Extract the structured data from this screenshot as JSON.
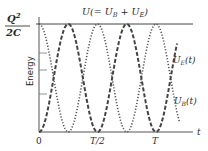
{
  "chart_data": {
    "type": "line",
    "title": "",
    "xlabel": "t",
    "ylabel": "Energy",
    "x_ticks": [
      {
        "label": "0",
        "value": 0
      },
      {
        "label": "T/2",
        "value": 0.5
      },
      {
        "label": "T",
        "value": 1.0
      }
    ],
    "y_max_label": {
      "numerator": "Q²",
      "denominator": "2C"
    },
    "xlim": [
      0,
      1.3
    ],
    "ylim": [
      0,
      1
    ],
    "grid": false,
    "legend": "inline",
    "series": [
      {
        "name": "U(= U_B + U_E)",
        "label": "U(= U_B + U_E)",
        "style": "solid",
        "formula": "U = Q²/2C (constant)",
        "x": [
          0,
          0.25,
          0.5,
          0.75,
          1.0,
          1.25
        ],
        "values": [
          1,
          1,
          1,
          1,
          1,
          1
        ]
      },
      {
        "name": "U_E(t)",
        "label": "U_E(t)",
        "style": "dotted",
        "formula": "U cos²(2πt/T)",
        "x": [
          0,
          0.125,
          0.25,
          0.375,
          0.5,
          0.625,
          0.75,
          0.875,
          1.0,
          1.125,
          1.25
        ],
        "values": [
          1,
          0.5,
          0,
          0.5,
          1,
          0.5,
          0,
          0.5,
          1,
          0.5,
          0
        ]
      },
      {
        "name": "U_B(t)",
        "label": "U_B(t)",
        "style": "dashed",
        "formula": "U sin²(2πt/T)",
        "x": [
          0,
          0.125,
          0.25,
          0.375,
          0.5,
          0.625,
          0.75,
          0.875,
          1.0,
          1.125,
          1.25
        ],
        "values": [
          0,
          0.5,
          1,
          0.5,
          0,
          0.5,
          1,
          0.5,
          0,
          0.5,
          1
        ]
      }
    ]
  },
  "labels": {
    "ymax_num": "Q",
    "ymax_sup": "2",
    "ymax_den": "2C",
    "total": "U(= U",
    "total_sub1": "B",
    "total_mid": " + U",
    "total_sub2": "E",
    "total_end": ")",
    "ue": "U",
    "ue_sub": "E",
    "ue_end": "(t)",
    "ub": "U",
    "ub_sub": "B",
    "ub_end": "(t)",
    "energy": "Energy",
    "x0": "0",
    "xhalf": "T/2",
    "xT": "T",
    "t": "t"
  },
  "colors": {
    "line": "#3a3a3a",
    "axis": "#555555",
    "text": "#2a2a2a"
  }
}
